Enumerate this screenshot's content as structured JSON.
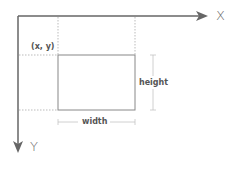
{
  "diagram": {
    "axes": {
      "x_label": "X",
      "y_label": "Y"
    },
    "rectangle": {
      "origin_label": "(x, y)",
      "width_label": "width",
      "height_label": "height"
    },
    "colors": {
      "axis": "#666666",
      "rect": "#888888",
      "dotted": "#aaaaaa",
      "dimension": "#bbbbbb"
    }
  }
}
